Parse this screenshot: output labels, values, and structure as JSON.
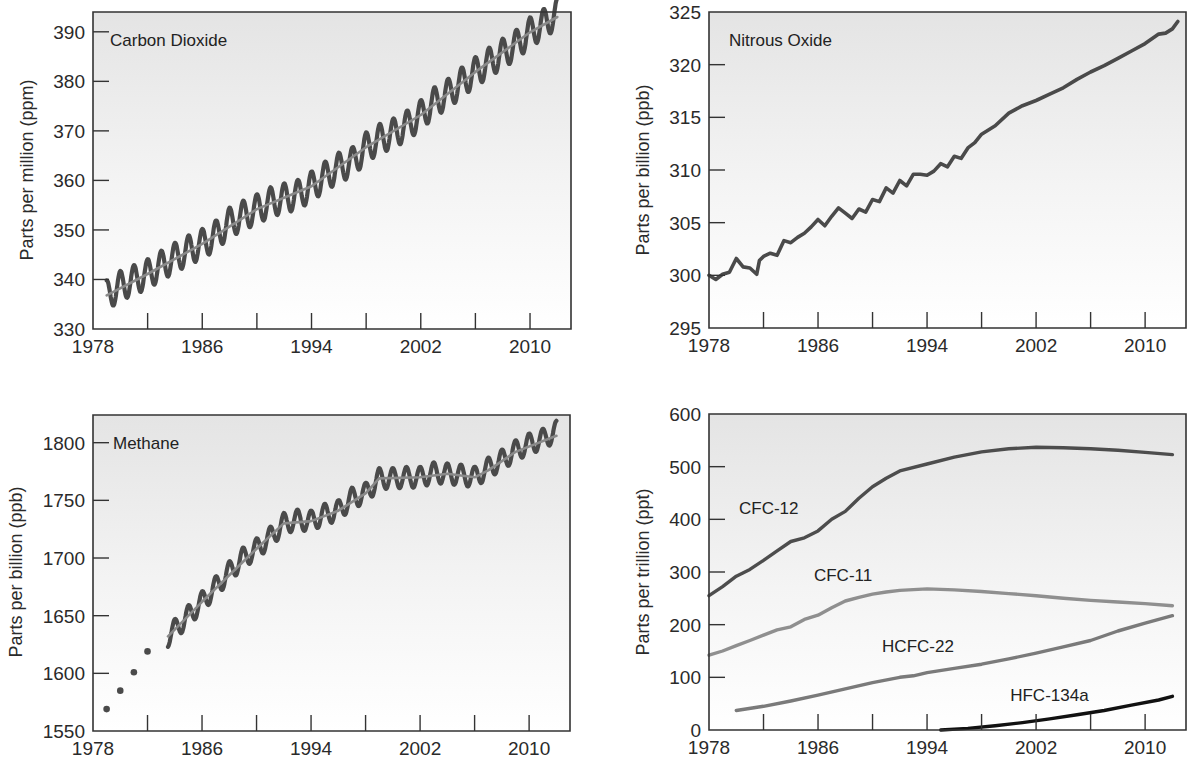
{
  "figure": {
    "panels": [
      "co2",
      "n2o",
      "ch4",
      "halocarbons"
    ]
  },
  "colors": {
    "raw_series": "#4a4a4a",
    "trend_line": "#8a8a8a",
    "cfc12": "#4d4d4d",
    "cfc11": "#8f8f8f",
    "hcfc22": "#7a7a7a",
    "hfc134a": "#111111",
    "frame": "#333333",
    "panel_bg_top": "#e6e6e6",
    "panel_bg_bottom": "#ffffff"
  },
  "chart_data": [
    {
      "id": "co2",
      "type": "line",
      "title": "Carbon Dioxide",
      "xlabel": "",
      "ylabel": "Parts per million (ppm)",
      "xlim": [
        1978,
        2013
      ],
      "ylim": [
        330,
        394
      ],
      "x_ticks": [
        1978,
        1982,
        1986,
        1990,
        1994,
        1998,
        2002,
        2006,
        2010
      ],
      "x_tick_labels": [
        "1978",
        "1986",
        "1994",
        "2002",
        "2010"
      ],
      "x_tick_label_values": [
        1978,
        1986,
        1994,
        2002,
        2010
      ],
      "y_ticks": [
        330,
        340,
        350,
        360,
        370,
        380,
        390
      ],
      "y_tick_labels": [
        "330",
        "340",
        "350",
        "360",
        "370",
        "380",
        "390"
      ],
      "grid": false,
      "series": [
        {
          "name": "Monthly CO2 (seasonal)",
          "style": "seasonal",
          "seasonal_amplitude": 3.0,
          "x": [
            1979,
            1980,
            1981,
            1982,
            1983,
            1984,
            1985,
            1986,
            1987,
            1988,
            1989,
            1990,
            1991,
            1992,
            1993,
            1994,
            1995,
            1996,
            1997,
            1998,
            1999,
            2000,
            2001,
            2002,
            2003,
            2004,
            2005,
            2006,
            2007,
            2008,
            2009,
            2010,
            2011,
            2012
          ],
          "values": [
            336.8,
            338.7,
            339.9,
            341.1,
            342.8,
            344.4,
            345.9,
            347.2,
            348.9,
            351.5,
            352.9,
            354.2,
            355.6,
            356.4,
            357.1,
            358.8,
            360.8,
            362.6,
            363.7,
            366.7,
            368.4,
            369.5,
            371.1,
            373.2,
            375.8,
            377.5,
            379.8,
            381.9,
            383.8,
            385.6,
            387.4,
            389.9,
            391.6,
            393.8
          ]
        },
        {
          "name": "Trend",
          "style": "trend",
          "x": [
            1979,
            1982,
            1986,
            1990,
            1994,
            1998,
            2002,
            2006,
            2010,
            2012
          ],
          "values": [
            336.8,
            341.1,
            347.2,
            354.2,
            358.8,
            366.7,
            373.2,
            381.9,
            389.9,
            393.0
          ]
        }
      ]
    },
    {
      "id": "n2o",
      "type": "line",
      "title": "Nitrous Oxide",
      "xlabel": "",
      "ylabel": "Parts per billion (ppb)",
      "xlim": [
        1978,
        2013
      ],
      "ylim": [
        295,
        325
      ],
      "x_ticks": [
        1978,
        1982,
        1986,
        1990,
        1994,
        1998,
        2002,
        2006,
        2010
      ],
      "x_tick_labels": [
        "1978",
        "1986",
        "1994",
        "2002",
        "2010"
      ],
      "x_tick_label_values": [
        1978,
        1986,
        1994,
        2002,
        2010
      ],
      "y_ticks": [
        295,
        300,
        305,
        310,
        315,
        320,
        325
      ],
      "y_tick_labels": [
        "295",
        "300",
        "305",
        "310",
        "315",
        "320",
        "325"
      ],
      "grid": false,
      "series": [
        {
          "name": "N2O",
          "style": "raw",
          "x": [
            1978.0,
            1978.5,
            1979.0,
            1979.5,
            1980.0,
            1980.5,
            1981.0,
            1981.5,
            1981.7,
            1982.0,
            1982.5,
            1983.0,
            1983.5,
            1984.0,
            1984.5,
            1985.0,
            1985.5,
            1986.0,
            1986.5,
            1987.0,
            1987.5,
            1988.0,
            1988.5,
            1989.0,
            1989.5,
            1990.0,
            1990.5,
            1991.0,
            1991.5,
            1992.0,
            1992.5,
            1993.0,
            1993.5,
            1994.0,
            1994.5,
            1995.0,
            1995.5,
            1996.0,
            1996.5,
            1997.0,
            1997.5,
            1998.0,
            1999.0,
            2000.0,
            2001.0,
            2002.0,
            2003.0,
            2004.0,
            2005.0,
            2006.0,
            2007.0,
            2008.0,
            2009.0,
            2010.0,
            2011.0,
            2011.5,
            2012.0,
            2012.4
          ],
          "values": [
            300.0,
            299.6,
            300.1,
            300.3,
            301.6,
            300.8,
            300.7,
            300.1,
            301.4,
            301.8,
            302.1,
            301.9,
            303.3,
            303.1,
            303.6,
            304.0,
            304.6,
            305.3,
            304.7,
            305.6,
            306.4,
            305.9,
            305.4,
            306.3,
            306.0,
            307.2,
            307.0,
            308.3,
            307.8,
            309.0,
            308.5,
            309.6,
            309.6,
            309.5,
            309.9,
            310.6,
            310.3,
            311.3,
            311.1,
            312.1,
            312.6,
            313.4,
            314.2,
            315.4,
            316.1,
            316.6,
            317.2,
            317.8,
            318.6,
            319.3,
            319.9,
            320.6,
            321.3,
            322.0,
            322.9,
            323.0,
            323.4,
            324.1
          ]
        }
      ]
    },
    {
      "id": "ch4",
      "type": "line",
      "title": "Methane",
      "xlabel": "",
      "ylabel": "Parts per billion (ppb)",
      "xlim": [
        1978,
        2013
      ],
      "ylim": [
        1550,
        1824
      ],
      "x_ticks": [
        1978,
        1982,
        1986,
        1990,
        1994,
        1998,
        2002,
        2006,
        2010
      ],
      "x_tick_labels": [
        "1978",
        "1986",
        "1994",
        "2002",
        "2010"
      ],
      "x_tick_label_values": [
        1978,
        1986,
        1994,
        2002,
        2010
      ],
      "y_ticks": [
        1550,
        1600,
        1650,
        1700,
        1750,
        1800
      ],
      "y_tick_labels": [
        "1550",
        "1600",
        "1650",
        "1700",
        "1750",
        "1800"
      ],
      "grid": false,
      "series": [
        {
          "name": "Early estimates",
          "style": "dots",
          "x": [
            1979.0,
            1980.0,
            1981.0,
            1982.0
          ],
          "values": [
            1569,
            1585,
            1601,
            1619
          ]
        },
        {
          "name": "Monthly CH4 (seasonal)",
          "style": "seasonal",
          "seasonal_amplitude": 9,
          "x": [
            1983.5,
            1984,
            1985,
            1986,
            1987,
            1988,
            1989,
            1990,
            1991,
            1992,
            1993,
            1994,
            1995,
            1996,
            1997,
            1998,
            1999,
            2000,
            2001,
            2002,
            2003,
            2004,
            2005,
            2006,
            2007,
            2008,
            2009,
            2010,
            2011,
            2012
          ],
          "values": [
            1632,
            1638,
            1650,
            1662,
            1675,
            1688,
            1700,
            1708,
            1718,
            1730,
            1733,
            1732,
            1738,
            1741,
            1752,
            1756,
            1769,
            1769,
            1770,
            1770,
            1774,
            1773,
            1772,
            1770,
            1778,
            1785,
            1793,
            1799,
            1803,
            1810
          ]
        },
        {
          "name": "Trend",
          "style": "trend",
          "x": [
            1983.5,
            1986,
            1990,
            1992,
            1994,
            1996,
            1998,
            1999,
            2002,
            2004,
            2006,
            2007,
            2009,
            2012
          ],
          "values": [
            1632,
            1662,
            1708,
            1730,
            1732,
            1741,
            1756,
            1769,
            1770,
            1773,
            1770,
            1776,
            1792,
            1806
          ]
        }
      ]
    },
    {
      "id": "halocarbons",
      "type": "line",
      "title": "",
      "xlabel": "",
      "ylabel": "Parts per trillion (ppt)",
      "xlim": [
        1978,
        2013
      ],
      "ylim": [
        0,
        600
      ],
      "x_ticks": [
        1978,
        1982,
        1986,
        1990,
        1994,
        1998,
        2002,
        2006,
        2010
      ],
      "x_tick_labels": [
        "1978",
        "1986",
        "1994",
        "2002",
        "2010"
      ],
      "x_tick_label_values": [
        1978,
        1986,
        1994,
        2002,
        2010
      ],
      "y_ticks": [
        0,
        100,
        200,
        300,
        400,
        500,
        600
      ],
      "y_tick_labels": [
        "0",
        "100",
        "200",
        "300",
        "400",
        "500",
        "600"
      ],
      "grid": false,
      "series": [
        {
          "name": "CFC-12",
          "label_x": 1980.2,
          "label_y": 410,
          "x": [
            1978,
            1979,
            1980,
            1981,
            1982,
            1983,
            1984,
            1985,
            1986,
            1987,
            1988,
            1989,
            1990,
            1991,
            1992,
            1994,
            1996,
            1998,
            2000,
            2002,
            2004,
            2006,
            2008,
            2010,
            2012
          ],
          "values": [
            255,
            272,
            292,
            305,
            322,
            340,
            358,
            365,
            378,
            400,
            415,
            440,
            462,
            478,
            492,
            505,
            518,
            528,
            534,
            537,
            536,
            534,
            531,
            527,
            523
          ]
        },
        {
          "name": "CFC-11",
          "label_x": 1985.7,
          "label_y": 283,
          "x": [
            1978,
            1979,
            1980,
            1981,
            1982,
            1983,
            1984,
            1985,
            1986,
            1987,
            1988,
            1989,
            1990,
            1991,
            1992,
            1994,
            1996,
            1998,
            2000,
            2002,
            2004,
            2006,
            2008,
            2010,
            2012
          ],
          "values": [
            142,
            150,
            160,
            170,
            180,
            190,
            196,
            210,
            218,
            232,
            245,
            252,
            258,
            262,
            265,
            268,
            266,
            263,
            259,
            255,
            250,
            246,
            243,
            240,
            236
          ]
        },
        {
          "name": "HCFC-22",
          "label_x": 1990.7,
          "label_y": 148,
          "x": [
            1980,
            1982,
            1984,
            1986,
            1988,
            1990,
            1992,
            1993,
            1994,
            1996,
            1998,
            2000,
            2002,
            2004,
            2006,
            2008,
            2010,
            2012
          ],
          "values": [
            37,
            45,
            55,
            66,
            78,
            90,
            100,
            103,
            109,
            117,
            125,
            135,
            146,
            158,
            170,
            188,
            203,
            217
          ]
        },
        {
          "name": "HFC-134a",
          "label_x": 2000.1,
          "label_y": 55,
          "x": [
            1995,
            1997,
            1999,
            2001,
            2003,
            2005,
            2007,
            2009,
            2011,
            2012
          ],
          "values": [
            0,
            3,
            8,
            14,
            21,
            29,
            37,
            47,
            57,
            64
          ]
        }
      ]
    }
  ]
}
